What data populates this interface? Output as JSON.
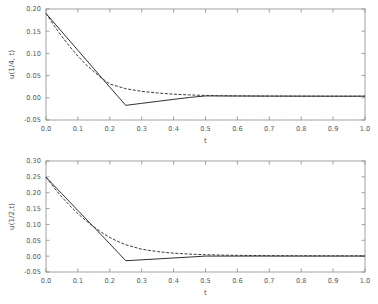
{
  "figure": {
    "background_color": "#ffffff",
    "axis_color": "#8c8c8c",
    "text_color": "#5a5a5a",
    "series_colors": {
      "solid": "#303030",
      "dashed": "#3a3a3a"
    }
  },
  "chart_data": [
    {
      "type": "line",
      "title": "",
      "xlabel": "t",
      "ylabel": "u(1/4, t)",
      "xlim": [
        0.0,
        1.0
      ],
      "ylim": [
        -0.05,
        0.2
      ],
      "grid": false,
      "legend": "none",
      "xticks": [
        "0.0",
        "0.1",
        "0.2",
        "0.3",
        "0.4",
        "0.5",
        "0.6",
        "0.7",
        "0.8",
        "0.9",
        "1.0"
      ],
      "xtick_values": [
        0.0,
        0.1,
        0.2,
        0.3,
        0.4,
        0.5,
        0.6,
        0.7,
        0.8,
        0.9,
        1.0
      ],
      "yticks": [
        "-0.05",
        "0.00",
        "0.05",
        "0.10",
        "0.15",
        "0.20"
      ],
      "ytick_values": [
        -0.05,
        0.0,
        0.05,
        0.1,
        0.15,
        0.2
      ],
      "series": [
        {
          "name": "numerical",
          "style": "solid",
          "x": [
            0.0,
            0.05,
            0.1,
            0.15,
            0.2,
            0.25,
            0.3,
            0.35,
            0.4,
            0.45,
            0.5,
            0.55,
            0.6,
            0.65,
            0.7,
            0.75,
            0.8,
            0.85,
            0.9,
            0.95,
            1.0
          ],
          "y": [
            0.19,
            0.1485,
            0.107,
            0.0655,
            0.024,
            -0.017,
            -0.0125,
            -0.008,
            -0.0035,
            0.0008,
            0.0042,
            0.0041,
            0.004,
            0.0039,
            0.0038,
            0.0038,
            0.0037,
            0.0037,
            0.0036,
            0.0036,
            0.0036
          ]
        },
        {
          "name": "exact",
          "style": "dashed",
          "x": [
            0.0,
            0.025,
            0.05,
            0.075,
            0.1,
            0.125,
            0.15,
            0.175,
            0.2,
            0.25,
            0.3,
            0.35,
            0.4,
            0.45,
            0.5,
            0.55,
            0.6,
            0.65,
            0.7,
            0.75,
            0.8,
            0.85,
            0.9,
            0.95,
            1.0
          ],
          "y": [
            0.19,
            0.163,
            0.138,
            0.115,
            0.094,
            0.075,
            0.059,
            0.044,
            0.031,
            0.0205,
            0.0145,
            0.0108,
            0.0082,
            0.0064,
            0.0053,
            0.0047,
            0.0043,
            0.0041,
            0.0039,
            0.0038,
            0.0037,
            0.0037,
            0.0036,
            0.0036,
            0.0036
          ]
        }
      ]
    },
    {
      "type": "line",
      "title": "",
      "xlabel": "t",
      "ylabel": "u(1/2,t)",
      "xlim": [
        0.0,
        1.0
      ],
      "ylim": [
        -0.05,
        0.3
      ],
      "grid": false,
      "legend": "none",
      "xticks": [
        "0.0",
        "0.1",
        "0.2",
        "0.3",
        "0.4",
        "0.5",
        "0.6",
        "0.7",
        "0.8",
        "0.9",
        "1.0"
      ],
      "xtick_values": [
        0.0,
        0.1,
        0.2,
        0.3,
        0.4,
        0.5,
        0.6,
        0.7,
        0.8,
        0.9,
        1.0
      ],
      "yticks": [
        "-0.05",
        "0.00",
        "0.05",
        "0.10",
        "0.15",
        "0.20",
        "0.25",
        "0.30"
      ],
      "ytick_values": [
        -0.05,
        0.0,
        0.05,
        0.1,
        0.15,
        0.2,
        0.25,
        0.3
      ],
      "series": [
        {
          "name": "numerical",
          "style": "solid",
          "x": [
            0.0,
            0.05,
            0.1,
            0.15,
            0.2,
            0.25,
            0.3,
            0.35,
            0.4,
            0.45,
            0.5,
            0.55,
            0.6,
            0.65,
            0.7,
            0.75,
            0.8,
            0.85,
            0.9,
            0.95,
            1.0
          ],
          "y": [
            0.249,
            0.1965,
            0.144,
            0.0915,
            0.039,
            -0.0145,
            -0.0116,
            -0.0087,
            -0.0058,
            -0.0029,
            0.0002,
            0.0002,
            0.0002,
            0.0002,
            0.0002,
            0.0002,
            0.0002,
            0.0002,
            0.0002,
            0.0002,
            0.0002
          ]
        },
        {
          "name": "exact",
          "style": "dashed",
          "x": [
            0.0,
            0.025,
            0.05,
            0.075,
            0.1,
            0.125,
            0.15,
            0.175,
            0.2,
            0.225,
            0.25,
            0.3,
            0.35,
            0.4,
            0.45,
            0.5,
            0.55,
            0.6,
            0.65,
            0.7,
            0.75,
            0.8,
            0.85,
            0.9,
            0.95,
            1.0
          ],
          "y": [
            0.249,
            0.216,
            0.186,
            0.159,
            0.134,
            0.112,
            0.0925,
            0.0745,
            0.059,
            0.0465,
            0.036,
            0.0218,
            0.0142,
            0.0094,
            0.0064,
            0.0045,
            0.0033,
            0.0025,
            0.002,
            0.0016,
            0.0014,
            0.0012,
            0.0011,
            0.001,
            0.001,
            0.001
          ]
        }
      ]
    }
  ]
}
